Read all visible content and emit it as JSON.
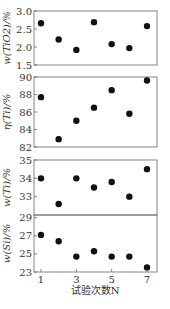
{
  "chart_data": {
    "type": "scatter",
    "xlabel": "试验次数N",
    "x": [
      1,
      2,
      3,
      4,
      5,
      6,
      7
    ],
    "x_ticks": [
      1,
      3,
      5,
      7
    ],
    "xlim": [
      0.8,
      7.2
    ],
    "panels": [
      {
        "ylabel": "w(TiO2)/%",
        "ylim": [
          1.5,
          3.0
        ],
        "y_ticks": [
          {
            "v": 1.5,
            "label": "1.5"
          },
          {
            "v": 2.0,
            "label": "2.0"
          },
          {
            "v": 2.5,
            "label": "2.5"
          },
          {
            "v": 3.0,
            "label": "3.0"
          }
        ],
        "values": [
          2.66,
          2.21,
          1.92,
          2.69,
          2.08,
          1.97,
          2.58
        ]
      },
      {
        "ylabel": "η(Ti)/%",
        "ylim": [
          82,
          90
        ],
        "y_ticks": [
          {
            "v": 82,
            "label": "82"
          },
          {
            "v": 84,
            "label": "84"
          },
          {
            "v": 86,
            "label": "86"
          },
          {
            "v": 88,
            "label": "88"
          },
          {
            "v": 90,
            "label": "90"
          }
        ],
        "values": [
          87.7,
          82.9,
          85.0,
          86.5,
          88.5,
          85.8,
          89.6
        ]
      },
      {
        "ylabel": "w(Ti)/%",
        "ylim": [
          32,
          35
        ],
        "y_ticks": [
          {
            "v": 33,
            "label": "33"
          },
          {
            "v": 34,
            "label": "34"
          },
          {
            "v": 35,
            "label": "35"
          }
        ],
        "values": [
          34.0,
          32.6,
          34.0,
          33.5,
          33.8,
          33.0,
          34.5
        ]
      },
      {
        "ylabel": "w(Si)/%",
        "ylim": [
          23,
          29.3
        ],
        "y_ticks": [
          {
            "v": 23,
            "label": "23"
          },
          {
            "v": 25,
            "label": "25"
          },
          {
            "v": 27,
            "label": "27"
          },
          {
            "v": 29,
            "label": "29"
          }
        ],
        "values": [
          27.1,
          26.4,
          24.7,
          25.3,
          24.7,
          24.7,
          23.5
        ]
      }
    ]
  },
  "layout": {
    "plot_left": 34,
    "plot_right": 157,
    "panels_px": [
      {
        "top": 11,
        "bottom": 65
      },
      {
        "top": 77,
        "bottom": 147
      },
      {
        "top": 160,
        "bottom": 215
      },
      {
        "top": 215,
        "bottom": 272
      }
    ],
    "x_tick_px": {
      "1": 41,
      "7": 147
    }
  }
}
